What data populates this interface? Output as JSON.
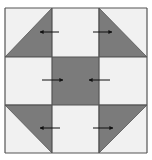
{
  "diagram": {
    "colors": {
      "background": "#ffffff",
      "light_fabric": "#f1f1f1",
      "dark_fabric": "#7b7b7b",
      "seam_line": "#555555",
      "arrow": "#111111"
    },
    "grid": {
      "x": [
        5,
        52,
        99,
        147
      ],
      "y": [
        8,
        57,
        105,
        153
      ]
    },
    "blocks": [
      {
        "name": "top-left-hst",
        "row": 0,
        "col": 0,
        "type": "hst",
        "dark_corner": "bottom-right",
        "diag": "bl-tr"
      },
      {
        "name": "top-center",
        "row": 0,
        "col": 1,
        "type": "light"
      },
      {
        "name": "top-right-hst",
        "row": 0,
        "col": 2,
        "type": "hst",
        "dark_corner": "bottom-left",
        "diag": "tl-br"
      },
      {
        "name": "middle-left",
        "row": 1,
        "col": 0,
        "type": "light"
      },
      {
        "name": "center-square",
        "row": 1,
        "col": 1,
        "type": "dark"
      },
      {
        "name": "middle-right",
        "row": 1,
        "col": 2,
        "type": "light"
      },
      {
        "name": "bottom-left-hst",
        "row": 2,
        "col": 0,
        "type": "hst",
        "dark_corner": "top-right",
        "diag": "tl-br"
      },
      {
        "name": "bottom-center",
        "row": 2,
        "col": 1,
        "type": "light"
      },
      {
        "name": "bottom-right-hst",
        "row": 2,
        "col": 2,
        "type": "hst",
        "dark_corner": "top-left",
        "diag": "bl-tr"
      }
    ],
    "arrows": [
      {
        "name": "arrow-top-left",
        "x1": 59,
        "y1": 32,
        "x2": 40,
        "y2": 32,
        "direction": "left"
      },
      {
        "name": "arrow-top-right",
        "x1": 93,
        "y1": 32,
        "x2": 112,
        "y2": 32,
        "direction": "right"
      },
      {
        "name": "arrow-middle-left",
        "x1": 42,
        "y1": 80,
        "x2": 63,
        "y2": 80,
        "direction": "right"
      },
      {
        "name": "arrow-middle-right",
        "x1": 110,
        "y1": 80,
        "x2": 89,
        "y2": 80,
        "direction": "left"
      },
      {
        "name": "arrow-bottom-left",
        "x1": 60,
        "y1": 128,
        "x2": 40,
        "y2": 128,
        "direction": "left"
      },
      {
        "name": "arrow-bottom-right",
        "x1": 93,
        "y1": 128,
        "x2": 113,
        "y2": 128,
        "direction": "right"
      }
    ]
  }
}
